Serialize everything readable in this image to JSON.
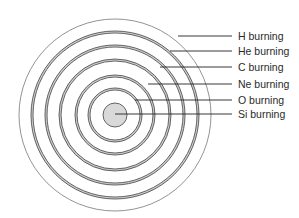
{
  "center": {
    "x": 115,
    "y": 115
  },
  "outer_radius": 96,
  "core": {
    "radius": 12,
    "fill": "#d9d9d9"
  },
  "shells": [
    {
      "name": "H burning",
      "outer_r": 84,
      "inner_r": 82,
      "label_y": 36,
      "line_start_x": 178
    },
    {
      "name": "He burning",
      "outer_r": 70,
      "inner_r": 68,
      "label_y": 51,
      "line_start_x": 170
    },
    {
      "name": "C burning",
      "outer_r": 56,
      "inner_r": 54,
      "label_y": 67,
      "line_start_x": 160
    },
    {
      "name": "Ne burning",
      "outer_r": 40,
      "inner_r": 38,
      "label_y": 84,
      "line_start_x": 148
    },
    {
      "name": "O burning",
      "outer_r": 27,
      "inner_r": 25,
      "label_y": 100,
      "line_start_x": 135
    },
    {
      "name": "Si burning",
      "outer_r": 0,
      "inner_r": 0,
      "label_y": 114,
      "line_start_x": 115
    }
  ],
  "leader_end_x": 232,
  "colors": {
    "stroke": "#555555",
    "shell_fill": "#cfcfcf",
    "text": "#2a2a2a"
  },
  "labels": [
    "H burning",
    "He burning",
    "C burning",
    "Ne burning",
    "O burning",
    "Si burning"
  ]
}
